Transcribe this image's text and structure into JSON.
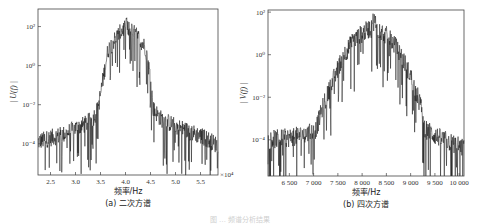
{
  "figure_caption": "图 … 频谱分析结果",
  "chart_data": [
    {
      "type": "line",
      "id": "a",
      "title": "(a) 二次方谱",
      "xlabel": "频率/Hz",
      "ylabel": "| U(f) |",
      "x_multiplier": "×10⁴",
      "yscale": "log",
      "xlim": [
        2.25,
        5.85
      ],
      "ylim_exp": [
        -5.6,
        2.9
      ],
      "xticks": [
        2.5,
        3.0,
        3.5,
        4.0,
        4.5,
        5.0,
        5.5
      ],
      "xtick_labels": [
        "2.5",
        "3.0",
        "3.5",
        "4.0",
        "4.5",
        "5.0",
        "5.5"
      ],
      "yticks_exp": [
        2,
        0,
        -2,
        -4
      ],
      "ytick_labels": [
        "10²",
        "10⁰",
        "10⁻²",
        "10⁻⁴"
      ],
      "envelope": {
        "x": [
          2.25,
          2.5,
          2.8,
          3.0,
          3.2,
          3.35,
          3.45,
          3.55,
          3.65,
          3.8,
          3.9,
          4.0,
          4.1,
          4.2,
          4.3,
          4.4,
          4.5,
          4.55,
          4.7,
          5.0,
          5.3,
          5.6,
          5.85
        ],
        "log10_y": [
          -3.9,
          -3.7,
          -3.5,
          -3.2,
          -3.0,
          -2.7,
          -2.2,
          -0.7,
          0.8,
          1.4,
          1.7,
          2.0,
          1.8,
          1.6,
          1.3,
          0.9,
          -0.6,
          -2.2,
          -2.7,
          -3.1,
          -3.4,
          -3.7,
          -4.1
        ]
      },
      "peak": {
        "x": 4.02,
        "log10_y": 2.3
      },
      "grid": false
    },
    {
      "type": "line",
      "id": "b",
      "title": "(b) 四次方谱",
      "xlabel": "频率/Hz",
      "ylabel": "| V(f) |",
      "yscale": "log",
      "xlim": [
        6060,
        10100
      ],
      "ylim_exp": [
        -5.7,
        2.1
      ],
      "xticks": [
        6500,
        7000,
        7500,
        8000,
        8500,
        9000,
        9500,
        10000
      ],
      "xtick_labels": [
        "6 500",
        "7 000",
        "7 500",
        "8 000",
        "8 500",
        "9 000",
        "9 500",
        "10 000"
      ],
      "yticks_exp": [
        2,
        0,
        -2,
        -4
      ],
      "ytick_labels": [
        "10²",
        "10⁰",
        "10⁻²",
        "10⁻⁴"
      ],
      "envelope": {
        "x": [
          6060,
          6500,
          6900,
          7050,
          7200,
          7400,
          7600,
          7800,
          8000,
          8200,
          8400,
          8600,
          8800,
          9000,
          9200,
          9300,
          9500,
          9800,
          10100
        ],
        "log10_y": [
          -4.0,
          -3.9,
          -3.7,
          -3.5,
          -2.4,
          -1.2,
          -0.1,
          0.6,
          1.0,
          1.3,
          1.1,
          0.7,
          0.0,
          -1.0,
          -2.3,
          -3.5,
          -3.8,
          -4.1,
          -4.4
        ]
      },
      "peak": {
        "x": 8250,
        "log10_y": 1.5
      },
      "grid": false
    }
  ]
}
